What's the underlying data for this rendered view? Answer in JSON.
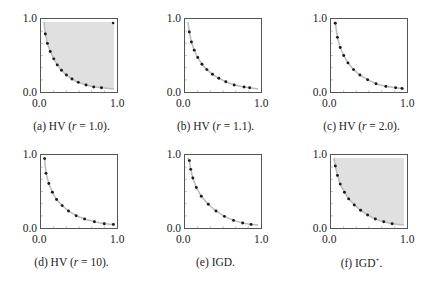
{
  "chart_data": [
    {
      "type": "scatter",
      "id": "a",
      "caption": "(a) HV (r = 1.0).",
      "caption_parts": {
        "label": "(a) HV (",
        "var": "r",
        "rest": " = 1.0)."
      },
      "xlim": [
        0,
        1
      ],
      "ylim": [
        0,
        1
      ],
      "xticks": [
        "0.0",
        "1.0"
      ],
      "yticks": [
        "0.0",
        "1.0"
      ],
      "shaded_region": "dominated-by-reference",
      "reference_point": [
        1.0,
        1.0
      ],
      "points": [
        [
          0.02,
          0.82
        ],
        [
          0.05,
          0.68
        ],
        [
          0.09,
          0.56
        ],
        [
          0.14,
          0.45
        ],
        [
          0.19,
          0.36
        ],
        [
          0.25,
          0.28
        ],
        [
          0.32,
          0.21
        ],
        [
          0.4,
          0.15
        ],
        [
          0.49,
          0.1
        ],
        [
          0.6,
          0.06
        ],
        [
          0.71,
          0.03
        ],
        [
          0.82,
          0.02
        ]
      ]
    },
    {
      "type": "scatter",
      "id": "b",
      "caption": "(b) HV (r = 1.1).",
      "caption_parts": {
        "label": "(b) HV (",
        "var": "r",
        "rest": " = 1.1)."
      },
      "xlim": [
        0,
        1
      ],
      "ylim": [
        0,
        1
      ],
      "xticks": [
        "0.0",
        "1.0"
      ],
      "yticks": [
        "0.0",
        "1.0"
      ],
      "shaded_region": "none",
      "points": [
        [
          0.02,
          0.85
        ],
        [
          0.05,
          0.7
        ],
        [
          0.09,
          0.58
        ],
        [
          0.14,
          0.47
        ],
        [
          0.2,
          0.37
        ],
        [
          0.27,
          0.29
        ],
        [
          0.35,
          0.22
        ],
        [
          0.44,
          0.16
        ],
        [
          0.54,
          0.11
        ],
        [
          0.66,
          0.06
        ],
        [
          0.8,
          0.03
        ],
        [
          0.88,
          0.02
        ]
      ]
    },
    {
      "type": "scatter",
      "id": "c",
      "caption": "(c) HV (r = 2.0).",
      "caption_parts": {
        "label": "(c) HV (",
        "var": "r",
        "rest": " = 2.0)."
      },
      "xlim": [
        0,
        1
      ],
      "ylim": [
        0,
        1
      ],
      "xticks": [
        "0.0",
        "1.0"
      ],
      "yticks": [
        "0.0",
        "1.0"
      ],
      "shaded_region": "none",
      "points": [
        [
          0.02,
          0.98
        ],
        [
          0.05,
          0.77
        ],
        [
          0.09,
          0.62
        ],
        [
          0.14,
          0.5
        ],
        [
          0.2,
          0.39
        ],
        [
          0.28,
          0.29
        ],
        [
          0.37,
          0.21
        ],
        [
          0.48,
          0.14
        ],
        [
          0.6,
          0.08
        ],
        [
          0.74,
          0.04
        ],
        [
          0.88,
          0.02
        ],
        [
          0.97,
          0.01
        ]
      ]
    },
    {
      "type": "scatter",
      "id": "d",
      "caption": "(d) HV (r = 10).",
      "caption_parts": {
        "label": "(d) HV (",
        "var": "r",
        "rest": " = 10)."
      },
      "xlim": [
        0,
        1
      ],
      "ylim": [
        0,
        1
      ],
      "xticks": [
        "0.0",
        "1.0"
      ],
      "yticks": [
        "0.0",
        "1.0"
      ],
      "shaded_region": "none",
      "points": [
        [
          0.01,
          0.99
        ],
        [
          0.03,
          0.77
        ],
        [
          0.07,
          0.62
        ],
        [
          0.12,
          0.49
        ],
        [
          0.18,
          0.38
        ],
        [
          0.26,
          0.29
        ],
        [
          0.35,
          0.21
        ],
        [
          0.46,
          0.14
        ],
        [
          0.58,
          0.09
        ],
        [
          0.72,
          0.05
        ],
        [
          0.86,
          0.02
        ],
        [
          0.99,
          0.01
        ]
      ]
    },
    {
      "type": "scatter",
      "id": "e",
      "caption": "(e) IGD.",
      "caption_parts": {
        "label": "(e) IGD.",
        "var": "",
        "rest": ""
      },
      "xlim": [
        0,
        1
      ],
      "ylim": [
        0,
        1
      ],
      "xticks": [
        "0.0",
        "1.0"
      ],
      "yticks": [
        "0.0",
        "1.0"
      ],
      "shaded_region": "none",
      "points": [
        [
          0.02,
          0.96
        ],
        [
          0.04,
          0.83
        ],
        [
          0.07,
          0.7
        ],
        [
          0.12,
          0.56
        ],
        [
          0.19,
          0.43
        ],
        [
          0.29,
          0.31
        ],
        [
          0.4,
          0.21
        ],
        [
          0.52,
          0.13
        ],
        [
          0.65,
          0.07
        ],
        [
          0.78,
          0.03
        ],
        [
          0.9,
          0.01
        ]
      ]
    },
    {
      "type": "scatter",
      "id": "f",
      "caption": "(f) IGD+.",
      "caption_parts": {
        "label": "(f) IGD",
        "var": "+",
        "rest": "."
      },
      "xlim": [
        0,
        1
      ],
      "ylim": [
        0,
        1
      ],
      "xticks": [
        "0.0",
        "1.0"
      ],
      "yticks": [
        "0.0",
        "1.0"
      ],
      "shaded_region": "dominated-by-front",
      "points": [
        [
          0.02,
          0.88
        ],
        [
          0.05,
          0.74
        ],
        [
          0.09,
          0.61
        ],
        [
          0.15,
          0.49
        ],
        [
          0.21,
          0.39
        ],
        [
          0.29,
          0.3
        ],
        [
          0.38,
          0.22
        ],
        [
          0.48,
          0.15
        ],
        [
          0.59,
          0.09
        ],
        [
          0.71,
          0.05
        ],
        [
          0.83,
          0.02
        ]
      ]
    }
  ],
  "style": {
    "point_color": "#1a1a1a",
    "curve_color": "#bdbdbd",
    "shade_color": "#e0e0e0",
    "axis_color": "#555555"
  }
}
